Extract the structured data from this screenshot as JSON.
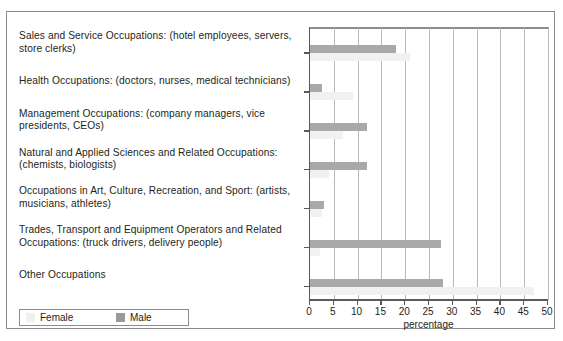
{
  "figure": {
    "border_color": "#8c8c8c",
    "background": "#ffffff"
  },
  "legend": {
    "position": "bottom-left",
    "entries": [
      {
        "label": "Female",
        "color": "#f1f1f1",
        "icon": "legend-swatch-female"
      },
      {
        "label": "Male",
        "color": "#9a9a9a",
        "icon": "legend-swatch-male"
      }
    ]
  },
  "chart_data": {
    "type": "bar",
    "orientation": "horizontal",
    "title": "",
    "subtitle": "",
    "xlabel": "percentage",
    "ylabel": "",
    "xlim": [
      0,
      50
    ],
    "xticks": [
      0,
      5,
      10,
      15,
      20,
      25,
      30,
      35,
      40,
      45,
      50
    ],
    "xticklabels": [
      "0",
      "5",
      "10",
      "15",
      "20",
      "25",
      "30",
      "35",
      "40",
      "45",
      "50"
    ],
    "grid": "vertical",
    "legend_position": "bottom-left",
    "categories": [
      "Sales and Service Occupations: (hotel employees, servers, store clerks)",
      "Health Occupations: (doctors, nurses, medical technicians)",
      "Management Occupations: (company managers, vice presidents, CEOs)",
      "Natural and Applied Sciences and Related Occupations: (chemists, biologists)",
      "Occupations in Art, Culture, Recreation, and Sport: (artists, musicians, athletes)",
      "Trades, Transport and Equipment Operators and Related Occupations: (truck drivers, delivery people)",
      "Other Occupations"
    ],
    "series": [
      {
        "name": "Female",
        "color": "#f1f1f1",
        "values": [
          21.0,
          9.0,
          7.0,
          4.0,
          2.5,
          2.0,
          47.0
        ]
      },
      {
        "name": "Male",
        "color": "#a9a9a9",
        "values": [
          18.0,
          2.5,
          12.0,
          12.0,
          3.0,
          27.5,
          28.0
        ]
      }
    ]
  }
}
